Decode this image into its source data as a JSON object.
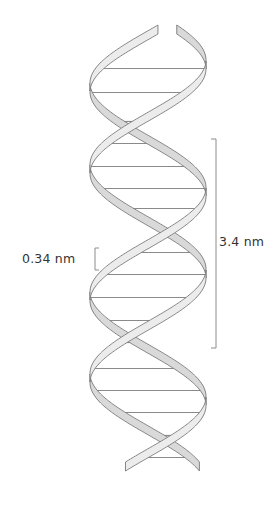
{
  "figure": {
    "colors": {
      "background": "#ffffff",
      "ribbon_fill": "#ececec",
      "ribbon_back_fill": "#d9d9d9",
      "ribbon_outline": "#7a7a7a",
      "rung": "#8a8a8a",
      "bracket": "#8c8c8c",
      "text": "#333333"
    },
    "helix": {
      "center_x": 148,
      "amplitude": 58,
      "top_y": 25,
      "bottom_y": 462,
      "pitch_px": 209,
      "ribbon_width_px": 9
    },
    "rungs_y": [
      64,
      88,
      117,
      139,
      162,
      184,
      204,
      226,
      248,
      270,
      293,
      316,
      338,
      364,
      386,
      408,
      431,
      453
    ],
    "annotations": {
      "base_pair_spacing": {
        "label": "0.34 nm",
        "bracket_x": 95,
        "bracket_y_top": 248,
        "bracket_y_bottom": 270
      },
      "helical_turn": {
        "label": "3.4 nm",
        "bracket_x": 216,
        "bracket_y_top": 139,
        "bracket_y_bottom": 348
      }
    }
  }
}
